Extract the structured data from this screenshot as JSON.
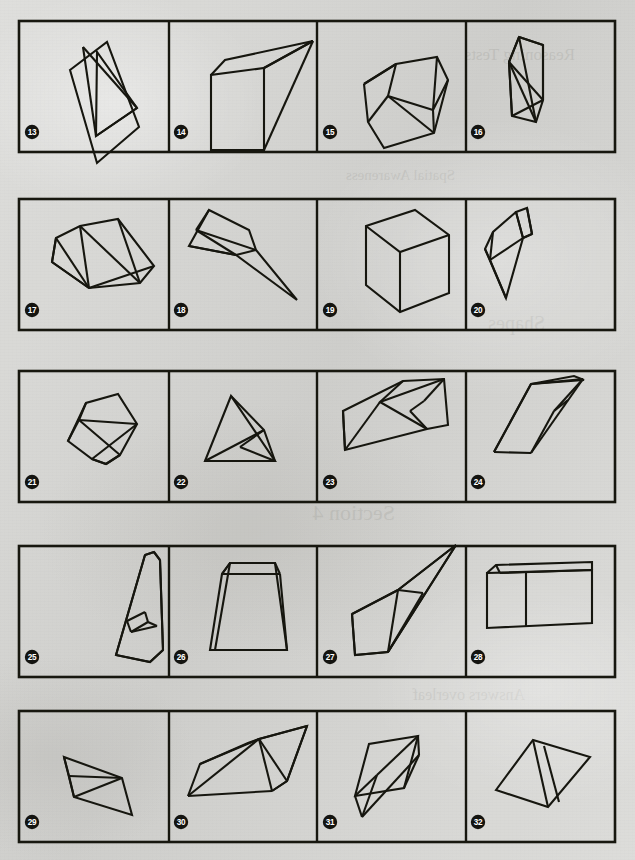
{
  "page": {
    "background_color": "#d9d9d6",
    "ink_color": "#16160f",
    "width": 635,
    "height": 860
  },
  "rows": [
    {
      "row_index": 0,
      "frame": {
        "x": 19,
        "y": 21,
        "width": 596,
        "height": 131
      },
      "dividers_x": [
        169,
        317,
        466
      ],
      "panels": [
        {
          "number": "13",
          "badge": {
            "cx": 32,
            "cy": 132
          },
          "figure_name": "tilted-rectangular-slab-with-diagonal-triangle"
        },
        {
          "number": "14",
          "badge": {
            "cx": 181,
            "cy": 132
          },
          "figure_name": "open-wedge-with-vertical-face"
        },
        {
          "number": "15",
          "badge": {
            "cx": 330,
            "cy": 132
          },
          "figure_name": "faceted-gem-block-with-crossing-edges"
        },
        {
          "number": "16",
          "badge": {
            "cx": 478,
            "cy": 132
          },
          "figure_name": "upright-triangular-prism-slab"
        }
      ]
    },
    {
      "row_index": 1,
      "frame": {
        "x": 19,
        "y": 199,
        "width": 596,
        "height": 131
      },
      "dividers_x": [
        169,
        317,
        466
      ],
      "panels": [
        {
          "number": "17",
          "badge": {
            "cx": 32,
            "cy": 310
          },
          "figure_name": "long-wedge-prism-lying-flat"
        },
        {
          "number": "18",
          "badge": {
            "cx": 181,
            "cy": 310
          },
          "figure_name": "elongated-tetrahedral-spike"
        },
        {
          "number": "19",
          "badge": {
            "cx": 330,
            "cy": 310
          },
          "figure_name": "plain-cube-in-perspective"
        },
        {
          "number": "20",
          "badge": {
            "cx": 478,
            "cy": 310
          },
          "figure_name": "triangular-prism-pointing-down"
        }
      ]
    },
    {
      "row_index": 2,
      "frame": {
        "x": 19,
        "y": 371,
        "width": 596,
        "height": 131
      },
      "dividers_x": [
        169,
        317,
        466
      ],
      "panels": [
        {
          "number": "21",
          "badge": {
            "cx": 32,
            "cy": 482
          },
          "figure_name": "tilted-cube-with-inner-diagonals"
        },
        {
          "number": "22",
          "badge": {
            "cx": 181,
            "cy": 482
          },
          "figure_name": "tetrahedron-with-visible-back-edge"
        },
        {
          "number": "23",
          "badge": {
            "cx": 330,
            "cy": 482
          },
          "figure_name": "slanted-wedge-with-notch-band"
        },
        {
          "number": "24",
          "badge": {
            "cx": 478,
            "cy": 482
          },
          "figure_name": "narrow-dart-tetrahedron"
        }
      ]
    },
    {
      "row_index": 3,
      "frame": {
        "x": 19,
        "y": 546,
        "width": 596,
        "height": 131
      },
      "dividers_x": [
        169,
        317,
        466
      ],
      "panels": [
        {
          "number": "25",
          "badge": {
            "cx": 32,
            "cy": 657
          },
          "figure_name": "letter-a-shaped-frame-solid"
        },
        {
          "number": "26",
          "badge": {
            "cx": 181,
            "cy": 657
          },
          "figure_name": "trapezoidal-bucket-prism"
        },
        {
          "number": "27",
          "badge": {
            "cx": 330,
            "cy": 657
          },
          "figure_name": "leaning-sliver-tetrahedron"
        },
        {
          "number": "28",
          "badge": {
            "cx": 478,
            "cy": 657
          },
          "figure_name": "rectangular-box-with-open-top"
        }
      ]
    },
    {
      "row_index": 4,
      "frame": {
        "x": 19,
        "y": 711,
        "width": 596,
        "height": 131
      },
      "dividers_x": [
        169,
        317,
        466
      ],
      "panels": [
        {
          "number": "29",
          "badge": {
            "cx": 32,
            "cy": 822
          },
          "figure_name": "small-folded-quadrilateral-fan"
        },
        {
          "number": "30",
          "badge": {
            "cx": 181,
            "cy": 822
          },
          "figure_name": "long-flat-rhomboid-with-creases"
        },
        {
          "number": "31",
          "badge": {
            "cx": 330,
            "cy": 822
          },
          "figure_name": "twisted-double-parallelogram"
        },
        {
          "number": "32",
          "badge": {
            "cx": 478,
            "cy": 822
          },
          "figure_name": "kite-quadrilateral-with-twin-ribs"
        }
      ]
    }
  ],
  "figures": {
    "f13": [
      "M 70,70 L 107,42 L 139,127 L 97,163 Z",
      "M 97,52 L 96,136 L 137,108 Z",
      "M 83,47 L 96,136",
      "M 96,136 L 137,108",
      "M 83,47 L 137,108"
    ],
    "f14": [
      "M 211,75 L 211,150 L 264,150 L 264,68 Z",
      "M 211,75 L 225,60 L 313,41 L 264,68",
      "M 264,68 L 313,41",
      "M 264,150 L 313,41"
    ],
    "f15": [
      "M 364,84 L 396,64 L 437,57 L 448,80 L 433,110 L 437,57",
      "M 364,84 L 368,122 L 384,148 L 434,133 L 448,80",
      "M 396,64 L 388,96 L 433,110",
      "M 388,96 L 368,122",
      "M 388,96 L 434,133",
      "M 433,110 L 434,133",
      "M 396,64 L 364,84"
    ],
    "f16": [
      "M 519,37 L 543,45 L 543,100 L 536,122 L 512,116 L 509,62 Z",
      "M 519,37 L 509,62 L 512,116",
      "M 509,62 L 536,122",
      "M 509,62 L 543,100",
      "M 512,116 L 543,100",
      "M 519,37 L 536,122",
      "M 543,45 L 543,100",
      "M 519,37 L 543,45"
    ],
    "f17": [
      "M 56,238 L 80,226 L 118,219 L 154,266 L 140,283 L 89,288 L 52,262 Z",
      "M 56,238 L 52,262",
      "M 56,238 L 89,288",
      "M 52,262 L 89,288",
      "M 80,226 L 89,288",
      "M 89,288 L 154,266",
      "M 118,219 L 140,283",
      "M 80,226 L 140,283"
    ],
    "f18": [
      "M 209,210 L 249,230 L 256,250 L 297,300 L 236,255 L 189,246 Z",
      "M 196,230 L 256,250",
      "M 196,230 L 236,255",
      "M 209,210 L 196,230",
      "M 236,255 L 256,250",
      "M 189,246 L 236,255"
    ],
    "f19": [
      "M 366,226 L 415,210 L 449,235 L 449,293 L 400,312 L 366,285 Z",
      "M 366,226 L 400,252 L 449,235",
      "M 400,252 L 400,312"
    ],
    "f20": [
      "M 516,212 L 527,208 L 532,234 L 523,238 Z",
      "M 516,212 L 493,232 L 485,249 L 490,260 L 523,238",
      "M 493,232 L 490,260",
      "M 490,260 L 506,298 L 523,238",
      "M 485,249 L 506,298",
      "M 532,234 L 523,238",
      "M 527,208 L 532,234",
      "M 516,212 L 523,238"
    ],
    "f21": [
      "M 68,441 L 86,403 L 118,394 L 137,424 L 120,455 L 106,464 L 92,459 Z",
      "M 86,403 L 79,420 L 120,455",
      "M 79,420 L 68,441",
      "M 79,420 L 137,424",
      "M 92,459 L 137,424",
      "M 92,459 L 106,464",
      "M 106,464 L 120,455"
    ],
    "f22": [
      "M 231,396 L 205,461 L 275,461 Z",
      "M 231,396 L 264,430 L 275,461",
      "M 205,461 L 264,430",
      "M 264,430 L 240,447",
      "M 240,447 L 275,461"
    ],
    "f23": [
      "M 343,411 L 403,381 L 444,379 L 448,425 L 427,429 L 345,450 Z",
      "M 343,411 L 345,450",
      "M 403,381 L 380,402 L 427,429",
      "M 380,402 L 345,450",
      "M 380,402 L 444,379",
      "M 424,401 L 410,411",
      "M 424,401 L 444,379",
      "M 410,411 L 427,429"
    ],
    "f24": [
      "M 494,452 L 531,384 L 584,380 L 574,376 L 531,384",
      "M 494,452 L 531,384",
      "M 531,384 L 583,379",
      "M 583,379 L 531,453",
      "M 494,452 L 531,453",
      "M 531,453 L 554,411",
      "M 554,411 L 583,379",
      "M 554,411 L 568,400"
    ],
    "f25": [
      "M 116,655 L 145,555 L 154,552 L 160,560 L 163,650 L 150,662 Z",
      "M 116,655 L 145,555",
      "M 145,555 L 154,552",
      "M 154,552 L 160,560",
      "M 160,560 L 163,650",
      "M 116,655 L 150,662",
      "M 150,662 L 163,650",
      "M 127,621 L 145,612",
      "M 145,612 L 148,622",
      "M 127,621 L 131,632",
      "M 131,632 L 148,622",
      "M 131,632 L 157,626",
      "M 148,622 L 157,626"
    ],
    "f26": [
      "M 230,563 L 275,563 L 287,650 L 215,650 Z",
      "M 230,563 L 222,574 L 210,650 L 215,650",
      "M 222,574 L 280,574",
      "M 280,574 L 275,563",
      "M 280,574 L 287,650",
      "M 222,574 L 230,563"
    ],
    "f27": [
      "M 398,590 L 456,545 L 388,652 L 355,655 L 352,614 Z",
      "M 398,590 L 352,614",
      "M 352,614 L 355,655",
      "M 355,655 L 388,652",
      "M 398,590 L 388,652",
      "M 398,590 L 456,545",
      "M 456,545 L 388,652",
      "M 398,590 L 423,593",
      "M 423,593 L 388,652"
    ],
    "f28": [
      "M 487,573 L 592,570 L 592,623 L 487,628 Z",
      "M 487,573 L 496,565 L 592,562 L 592,570",
      "M 496,565 L 500,573",
      "M 500,573 L 592,570",
      "M 526,573 L 526,626"
    ],
    "f29": [
      "M 64,757 L 122,778 L 132,815 L 74,797 Z",
      "M 64,757 L 69,776",
      "M 69,776 L 122,778",
      "M 69,776 L 74,797",
      "M 74,797 L 122,778"
    ],
    "f30": [
      "M 188,796 L 200,764 L 248,743 L 259,739 L 307,726 L 287,781 L 272,791",
      "M 188,796 L 259,739",
      "M 188,796 L 272,791",
      "M 200,764 L 259,739",
      "M 259,739 L 307,726",
      "M 259,739 L 287,781",
      "M 272,791 L 287,781",
      "M 259,739 L 272,791",
      "M 287,781 L 307,726"
    ],
    "f31": [
      "M 355,796 L 369,744 L 418,736 L 404,788 Z",
      "M 362,817 L 419,755",
      "M 362,817 L 377,775",
      "M 377,775 L 418,736",
      "M 419,755 L 418,736",
      "M 355,796 L 377,775",
      "M 362,817 L 355,796",
      "M 404,788 L 419,755"
    ],
    "f32": [
      "M 496,790 L 533,740 L 590,757 L 548,807 Z",
      "M 533,740 L 548,807",
      "M 544,746 L 559,802"
    ]
  }
}
